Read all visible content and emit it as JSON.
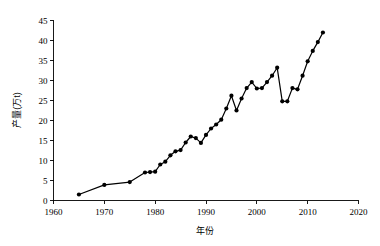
{
  "chart_data": {
    "type": "line",
    "title": "",
    "xlabel": "年份",
    "ylabel": "产量(万t)",
    "xlim": [
      1960,
      2020
    ],
    "ylim": [
      0,
      45
    ],
    "xticks": [
      1960,
      1970,
      1980,
      1990,
      2000,
      2010,
      2020
    ],
    "yticks": [
      0,
      5,
      10,
      15,
      20,
      25,
      30,
      35,
      40,
      45
    ],
    "grid": false,
    "legend": false,
    "legend_position": "none",
    "marker": "filled-circle",
    "line_color": "#000000",
    "marker_color": "#000000",
    "series": [
      {
        "name": "产量",
        "x": [
          1965,
          1970,
          1975,
          1978,
          1979,
          1980,
          1981,
          1982,
          1983,
          1984,
          1985,
          1986,
          1987,
          1988,
          1989,
          1990,
          1991,
          1992,
          1993,
          1994,
          1995,
          1996,
          1997,
          1998,
          1999,
          2000,
          2001,
          2002,
          2003,
          2004,
          2005,
          2006,
          2007,
          2008,
          2009,
          2010,
          2011,
          2012,
          2013
        ],
        "values": [
          1.5,
          3.9,
          4.6,
          7.0,
          7.1,
          7.2,
          9.0,
          9.7,
          11.3,
          12.3,
          12.6,
          14.5,
          16.0,
          15.6,
          14.4,
          16.4,
          18.0,
          19.0,
          20.2,
          23.0,
          26.2,
          22.5,
          25.5,
          28.1,
          29.6,
          28.0,
          28.1,
          29.6,
          31.2,
          33.2,
          24.8,
          24.8,
          28.1,
          27.8,
          31.2,
          34.8,
          37.4,
          39.6,
          42.0
        ]
      }
    ]
  },
  "axes": {
    "x_tick_labels": [
      "1960",
      "1970",
      "1980",
      "1990",
      "2000",
      "2010",
      "2020"
    ],
    "y_tick_labels": [
      "0",
      "5",
      "10",
      "15",
      "20",
      "25",
      "30",
      "35",
      "40",
      "45"
    ],
    "x_axis_title": "年份",
    "y_axis_title": "产量(万t)"
  }
}
